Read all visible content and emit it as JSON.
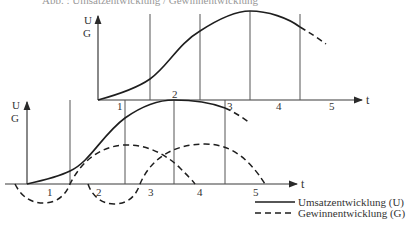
{
  "caption": "Abb. : Umsatzentwicklung / Gewinnentwicklung",
  "upper_chart": {
    "y_axis_label_top": "U",
    "y_axis_label_bottom": "G",
    "x_axis_label": "t",
    "phase_labels": [
      "1",
      "2",
      "3",
      "4",
      "5"
    ]
  },
  "lower_chart": {
    "y_axis_label_top": "U",
    "y_axis_label_bottom": "G",
    "x_axis_label": "t",
    "phase_labels": [
      "1",
      "2",
      "3",
      "4",
      "5"
    ]
  },
  "legend": {
    "items": [
      {
        "label": "Umsatzentwicklung (U)",
        "style": "solid"
      },
      {
        "label": "Gewinnentwicklung (G)",
        "style": "dashed"
      }
    ]
  },
  "colors": {
    "line": "#1e1e1e",
    "axis": "#3a3a3a",
    "text": "#333333",
    "background": "#ffffff"
  }
}
